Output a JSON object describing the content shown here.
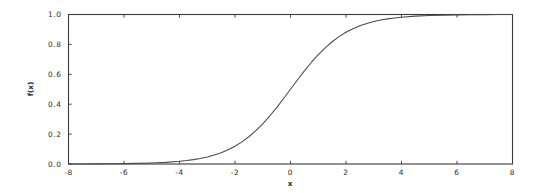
{
  "figure": {
    "background_color": "#ffffff",
    "axes_color": "#3a3a3a",
    "curve_color": "#4a4a4a",
    "text_color": "#2b2b2b"
  },
  "chart_data": {
    "type": "line",
    "title": "",
    "subtitle": "",
    "xlabel": "x",
    "ylabel": "f(x)",
    "xlim": [
      -8,
      8
    ],
    "ylim": [
      0.0,
      1.0
    ],
    "grid": false,
    "legend": null,
    "legend_position": "none",
    "x_ticks": [
      -8,
      -6,
      -4,
      -2,
      0,
      2,
      4,
      6,
      8
    ],
    "x_tick_labels": [
      "-8",
      "-6",
      "-4",
      "-2",
      "0",
      "2",
      "4",
      "6",
      "8"
    ],
    "y_ticks": [
      0.0,
      0.2,
      0.4,
      0.6,
      0.8,
      1.0
    ],
    "y_tick_labels": [
      "0.0",
      "0.2",
      "0.4",
      "0.6",
      "0.8",
      "1.0"
    ],
    "tick_direction": "in",
    "series": [
      {
        "name": "sigmoid",
        "color": "#4a4a4a",
        "linewidth": 1.05,
        "x": [
          -8.0,
          -7.5,
          -7.0,
          -6.5,
          -6.0,
          -5.5,
          -5.0,
          -4.5,
          -4.0,
          -3.75,
          -3.5,
          -3.25,
          -3.0,
          -2.75,
          -2.5,
          -2.25,
          -2.0,
          -1.75,
          -1.5,
          -1.25,
          -1.0,
          -0.75,
          -0.5,
          -0.25,
          0.0,
          0.25,
          0.5,
          0.75,
          1.0,
          1.25,
          1.5,
          1.75,
          2.0,
          2.25,
          2.5,
          2.75,
          3.0,
          3.25,
          3.5,
          3.75,
          4.0,
          4.5,
          5.0,
          5.5,
          6.0,
          6.5,
          7.0,
          7.5,
          8.0
        ],
        "y": [
          0.0003,
          0.0006,
          0.0009,
          0.0015,
          0.0025,
          0.0041,
          0.0067,
          0.011,
          0.018,
          0.023,
          0.0293,
          0.0373,
          0.0474,
          0.0601,
          0.0759,
          0.0952,
          0.1192,
          0.148,
          0.1824,
          0.2227,
          0.2689,
          0.3208,
          0.3775,
          0.4378,
          0.5,
          0.5622,
          0.6225,
          0.6792,
          0.7311,
          0.7773,
          0.8176,
          0.852,
          0.8808,
          0.9048,
          0.9241,
          0.9399,
          0.9526,
          0.9627,
          0.9707,
          0.977,
          0.982,
          0.989,
          0.9933,
          0.9959,
          0.9975,
          0.9985,
          0.9991,
          0.9994,
          0.9997
        ]
      }
    ]
  }
}
